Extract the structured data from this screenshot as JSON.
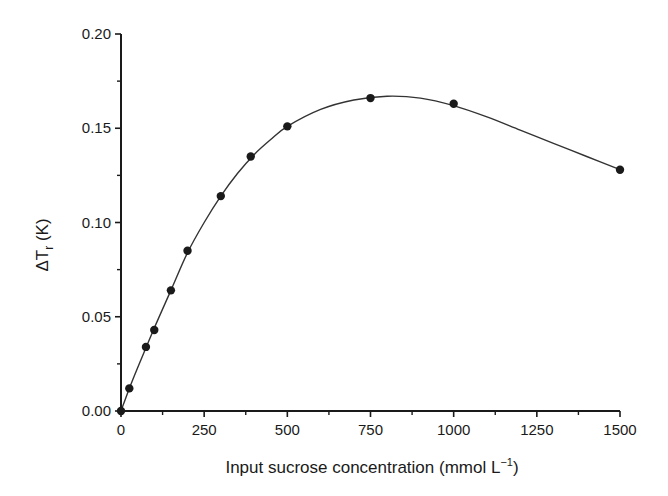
{
  "chart_data": {
    "type": "scatter",
    "title": "",
    "xlabel": "Input sucrose concentration (mmol L⁻¹)",
    "ylabel": "ΔTᵣ (K)",
    "ylabel_main": "ΔT",
    "ylabel_sub": "r",
    "ylabel_unit": " (K)",
    "xlabel_main": "Input sucrose concentration (mmol L",
    "xlabel_sup": "−1",
    "xlabel_end": ")",
    "xlim": [
      0,
      1500
    ],
    "ylim": [
      0,
      0.2
    ],
    "x_ticks": [
      "0",
      "250",
      "500",
      "750",
      "1000",
      "1250",
      "1500"
    ],
    "y_ticks": [
      "0.00",
      "0.05",
      "0.10",
      "0.15",
      "0.20"
    ],
    "grid": false,
    "legend": null,
    "series": [
      {
        "name": "measured",
        "kind": "points",
        "x": [
          0,
          25,
          75,
          100,
          150,
          200,
          300,
          390,
          500,
          750,
          1000,
          1500
        ],
        "y": [
          0.0,
          0.012,
          0.034,
          0.043,
          0.064,
          0.085,
          0.114,
          0.135,
          0.151,
          0.166,
          0.163,
          0.128
        ]
      },
      {
        "name": "fitted curve",
        "kind": "line",
        "x": [
          0,
          25,
          50,
          100,
          150,
          200,
          250,
          300,
          350,
          400,
          450,
          500,
          600,
          700,
          800,
          900,
          1000,
          1100,
          1200,
          1300,
          1400,
          1500
        ],
        "y": [
          0.0,
          0.012,
          0.023,
          0.044,
          0.064,
          0.084,
          0.1,
          0.114,
          0.126,
          0.136,
          0.144,
          0.151,
          0.16,
          0.165,
          0.167,
          0.166,
          0.162,
          0.156,
          0.149,
          0.142,
          0.135,
          0.128
        ]
      }
    ]
  },
  "colors": {
    "ink": "#1a1a1a",
    "curve": "#333333",
    "background": "#ffffff"
  }
}
